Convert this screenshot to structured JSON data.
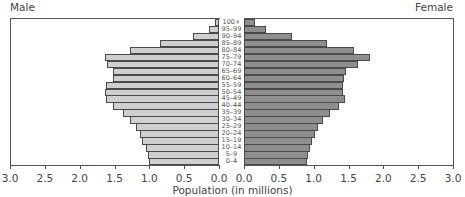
{
  "chart_data": {
    "type": "bar",
    "subtype": "population-pyramid",
    "title": "",
    "xlabel": "Population (in millions)",
    "ylabel": "",
    "left_label": "Male",
    "right_label": "Female",
    "xlim": [
      0,
      3.0
    ],
    "x_ticks": [
      "0.0",
      "0.5",
      "1.0",
      "1.5",
      "2.0",
      "2.5",
      "3.0"
    ],
    "grid": false,
    "categories": [
      "100+",
      "95–99",
      "90–94",
      "85–89",
      "80–84",
      "75–79",
      "70–74",
      "65–69",
      "60–64",
      "55–59",
      "50–54",
      "45–49",
      "40–44",
      "35–39",
      "30–34",
      "25–29",
      "20–24",
      "15–19",
      "10–14",
      "5–9",
      "0–4"
    ],
    "series": [
      {
        "name": "Male",
        "color": "#cfcfcf",
        "values": [
          0.06,
          0.14,
          0.37,
          0.85,
          1.28,
          1.64,
          1.61,
          1.52,
          1.52,
          1.62,
          1.64,
          1.62,
          1.52,
          1.38,
          1.28,
          1.19,
          1.13,
          1.1,
          1.05,
          1.02,
          1.0
        ]
      },
      {
        "name": "Female",
        "color": "#8e8e8e",
        "values": [
          0.16,
          0.32,
          0.69,
          1.19,
          1.58,
          1.81,
          1.64,
          1.46,
          1.43,
          1.42,
          1.42,
          1.45,
          1.36,
          1.23,
          1.13,
          1.06,
          1.02,
          0.98,
          0.95,
          0.92,
          0.9
        ]
      }
    ]
  }
}
